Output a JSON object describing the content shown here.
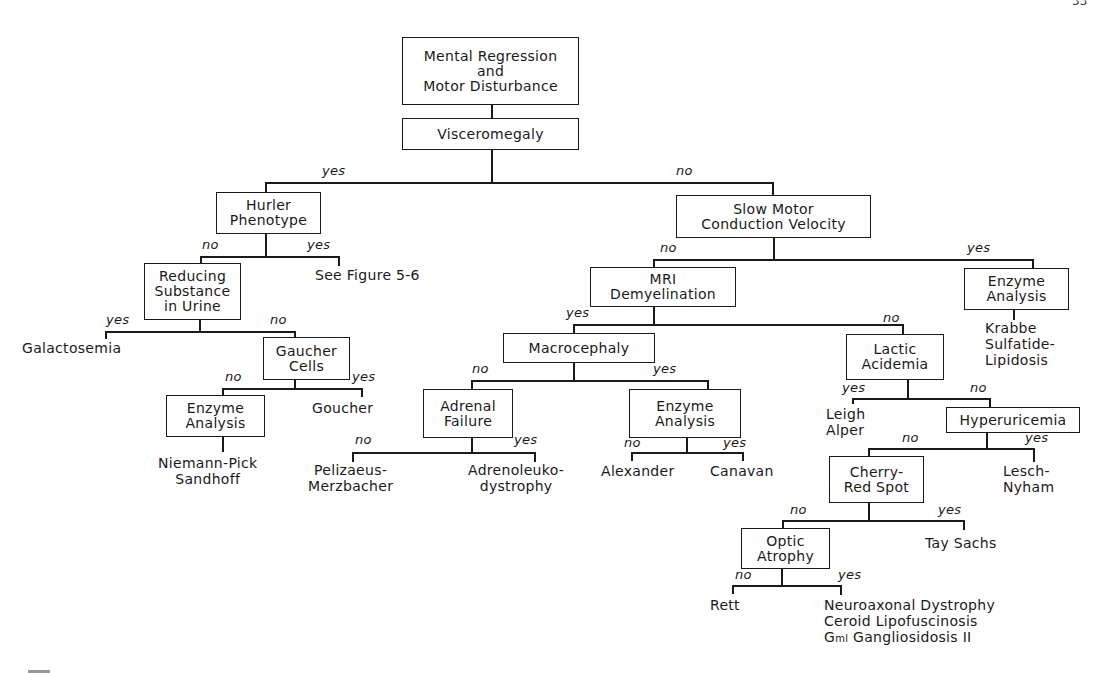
{
  "page_number": "33",
  "root": {
    "lines": [
      "Mental Regression",
      "and",
      "Motor Disturbance"
    ]
  },
  "visceromegaly": {
    "label": "Visceromegaly"
  },
  "branch_labels": {
    "viscero_yes": "yes",
    "viscero_no": "no",
    "hurler_no": "no",
    "hurler_yes": "yes",
    "reducing_yes": "yes",
    "reducing_no": "no",
    "gaucher_no": "no",
    "gaucher_yes": "yes",
    "smcv_no": "no",
    "smcv_yes": "yes",
    "mri_yes": "yes",
    "mri_no": "no",
    "macro_no": "no",
    "macro_yes": "yes",
    "adrenal_no": "no",
    "adrenal_yes": "yes",
    "enzyme2_no": "no",
    "enzyme2_yes": "yes",
    "lactic_yes": "yes",
    "lactic_no": "no",
    "hyper_no": "no",
    "hyper_yes": "yes",
    "cherry_no": "no",
    "cherry_yes": "yes",
    "optic_no": "no",
    "optic_yes": "yes"
  },
  "nodes": {
    "hurler": [
      "Hurler",
      "Phenotype"
    ],
    "reducing": [
      "Reducing",
      "Substance",
      "in Urine"
    ],
    "gaucher_cells": [
      "Gaucher",
      "Cells"
    ],
    "enzyme_left": [
      "Enzyme",
      "Analysis"
    ],
    "smcv": [
      "Slow Motor",
      "Conduction Velocity"
    ],
    "mri": [
      "MRI",
      "Demyelination"
    ],
    "enzyme_right": [
      "Enzyme",
      "Analysis"
    ],
    "macrocephaly": [
      "Macrocephaly"
    ],
    "adrenal": [
      "Adrenal",
      "Failure"
    ],
    "enzyme_mid": [
      "Enzyme",
      "Analysis"
    ],
    "lactic": [
      "Lactic",
      "Acidemia"
    ],
    "hyperuricemia": [
      "Hyperuricemia"
    ],
    "cherry": [
      "Cherry-",
      "Red Spot"
    ],
    "optic": [
      "Optic",
      "Atrophy"
    ]
  },
  "leaves": {
    "see_figure": [
      "See Figure 5-6"
    ],
    "galactosemia": [
      "Galactosemia"
    ],
    "goucher": [
      "Goucher"
    ],
    "niemann": [
      "Niemann-Pick",
      "Sandhoff"
    ],
    "krabbe": [
      "Krabbe",
      "Sulfatide-",
      "Lipidosis"
    ],
    "pelizaeus": [
      "Pelizaeus-",
      "Merzbacher"
    ],
    "adrenoleuko": [
      "Adrenoleuko-",
      "dystrophy"
    ],
    "alexander": [
      "Alexander"
    ],
    "canavan": [
      "Canavan"
    ],
    "leigh": [
      "Leigh",
      "Alper"
    ],
    "lesch": [
      "Lesch-",
      "Nyham"
    ],
    "tay_sachs": [
      "Tay Sachs"
    ],
    "rett": [
      "Rett"
    ],
    "neuro": [
      "Neuroaxonal Dystrophy",
      "Ceroid Lipofuscinosis"
    ],
    "gm1_prefix": "G",
    "gm1_sub": "ml",
    "gm1_rest": " Gangliosidosis II"
  }
}
